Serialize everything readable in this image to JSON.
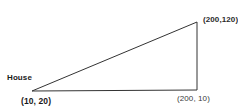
{
  "diagram": {
    "background_color": "#ffffff",
    "stroke_color": "#333333",
    "text_color": "#1a1a1a",
    "width": 238,
    "height": 111,
    "shape": {
      "type": "right-triangle",
      "points": "32,91 197,22 197,90"
    },
    "labels": {
      "house": "House",
      "house_coord": "(10, 20)",
      "bottom_right_coord": "(200, 10)",
      "top_right_coord": "(200,120)",
      "top_clipped": "Service"
    }
  }
}
